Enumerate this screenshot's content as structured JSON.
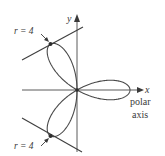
{
  "figure": {
    "type": "polar-rose-diagram",
    "curve": "three-petaled rose",
    "colors": {
      "background": "#ffffff",
      "curve": "#4a4a4a",
      "axes": "#5a5a5a",
      "tangent": "#3e3e3e",
      "text": "#3a3a3a"
    },
    "axes": {
      "x_label": "x",
      "y_label": "y",
      "polar_axis_label_line1": "polar",
      "polar_axis_label_line2": "axis"
    },
    "annotations": {
      "top_tangent_label": "r = 4",
      "bottom_tangent_label": "r = 4"
    },
    "petals": [
      {
        "name": "right",
        "angle_deg": 0,
        "tip_r": 4
      },
      {
        "name": "upper-left",
        "angle_deg": 120,
        "tip_r": 4
      },
      {
        "name": "lower-left",
        "angle_deg": 240,
        "tip_r": 4
      }
    ]
  }
}
